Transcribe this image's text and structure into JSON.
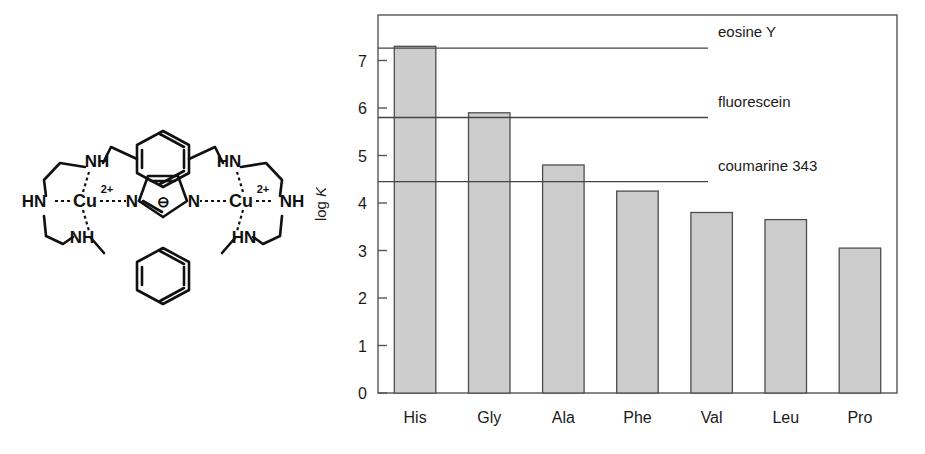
{
  "figure": {
    "panels": [
      "structure",
      "chart"
    ]
  },
  "structure": {
    "name": "dinuclear copper(II) imidazolate cryptand complex",
    "atom_labels": [
      {
        "id": "hn-left",
        "text": "HN"
      },
      {
        "id": "nh-upper-left",
        "text": "NH"
      },
      {
        "id": "nh-lower-left",
        "text": "NH"
      },
      {
        "id": "cu-left",
        "text": "Cu"
      },
      {
        "id": "cu-left-charge",
        "text": "2+"
      },
      {
        "id": "n-imid-left",
        "text": "N"
      },
      {
        "id": "imid-charge",
        "text": "⊖"
      },
      {
        "id": "n-imid-right",
        "text": "N"
      },
      {
        "id": "cu-right",
        "text": "Cu"
      },
      {
        "id": "cu-right-charge",
        "text": "2+"
      },
      {
        "id": "nh-right",
        "text": "NH"
      },
      {
        "id": "hn-upper-right",
        "text": "HN"
      },
      {
        "id": "hn-lower-right",
        "text": "HN"
      }
    ],
    "colors": {
      "bond": "#111111",
      "text": "#111111"
    }
  },
  "chart_data": {
    "type": "bar",
    "title": "",
    "xlabel": "",
    "ylabel": "log K",
    "ylabel_parts": {
      "prefix": "log ",
      "italic": "K"
    },
    "categories": [
      "His",
      "Gly",
      "Ala",
      "Phe",
      "Val",
      "Leu",
      "Pro"
    ],
    "values": [
      7.3,
      5.9,
      4.8,
      4.25,
      3.8,
      3.65,
      3.05
    ],
    "series": [
      {
        "name": "log K",
        "values": [
          7.3,
          5.9,
          4.8,
          4.25,
          3.8,
          3.65,
          3.05
        ]
      }
    ],
    "ylim": [
      0,
      8
    ],
    "yticks": [
      0,
      1,
      2,
      3,
      4,
      5,
      6,
      7
    ],
    "ytick_labels": [
      "0",
      "1",
      "2",
      "3",
      "4",
      "5",
      "6",
      "7"
    ],
    "grid": false,
    "legend_position": "right-inside",
    "reference_lines": [
      {
        "label": "eosine Y",
        "value": 7.26
      },
      {
        "label": "fluorescein",
        "value": 5.8
      },
      {
        "label": "coumarine 343",
        "value": 4.45
      }
    ],
    "colors": {
      "bar_fill": "#cdcdcd",
      "bar_stroke": "#4d4d4d",
      "axis": "#555555",
      "reference_line": "#444444",
      "text": "#1a1a1a"
    }
  }
}
